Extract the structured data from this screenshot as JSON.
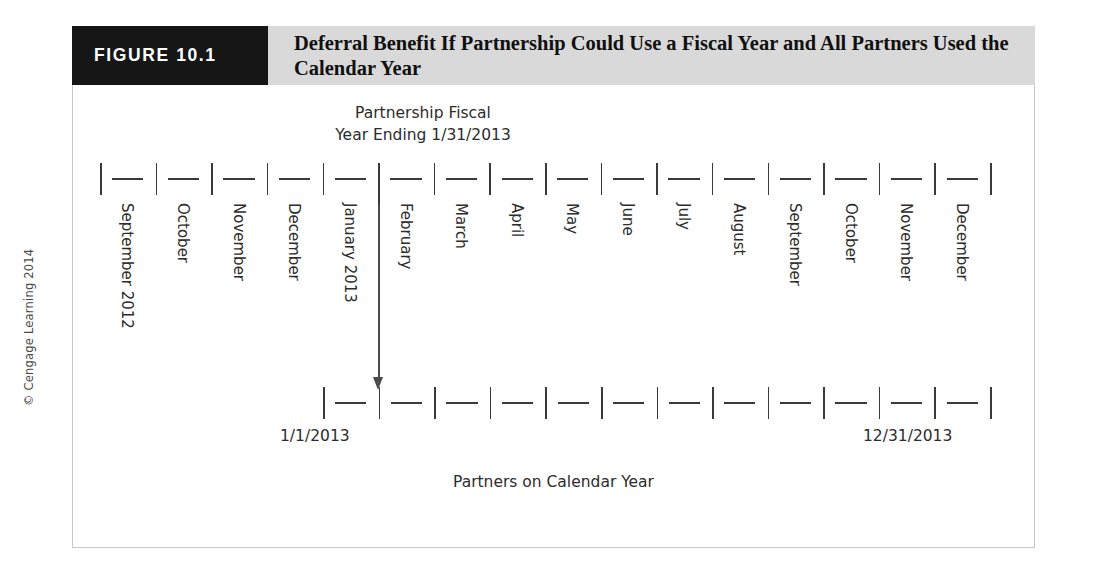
{
  "copyright": "© Cengage Learning 2014",
  "figure": {
    "number_label": "FIGURE 10.1",
    "title": "Deferral Benefit If Partnership Could Use a Fiscal Year and All Partners Used the Calendar Year"
  },
  "fiscal_caption": {
    "line1": "Partnership Fiscal",
    "line2": "Year Ending 1/31/2013"
  },
  "timeline_top": {
    "months": [
      "September 2012",
      "October",
      "November",
      "December",
      "January 2013",
      "February",
      "March",
      "April",
      "May",
      "June",
      "July",
      "August",
      "September",
      "October",
      "November",
      "December"
    ],
    "segment_count": 16,
    "arrow_from_month": "February"
  },
  "timeline_bottom": {
    "segment_count": 12,
    "start_label": "1/1/2013",
    "end_label": "12/31/2013",
    "caption": "Partners on Calendar Year"
  },
  "colors": {
    "header_band": "#d9d9d9",
    "number_block": "#161616",
    "number_text": "#ffffff",
    "title_text": "#101010",
    "rule": "#3a3a3a",
    "border": "#c6c6c6",
    "arrow": "#4b4b4b"
  }
}
